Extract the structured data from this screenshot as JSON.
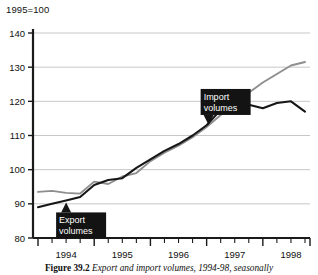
{
  "chart_data": {
    "type": "line",
    "title": "1995=100",
    "xlabel": "",
    "ylabel": "",
    "ylim": [
      80,
      140
    ],
    "yticks": [
      80,
      90,
      100,
      110,
      120,
      130,
      140
    ],
    "grid": true,
    "legend_position": "inline-callouts",
    "x_tick_labels": [
      "1994",
      "1995",
      "1996",
      "1997",
      "1998"
    ],
    "x": [
      "1994Q1",
      "1994Q2",
      "1994Q3",
      "1994Q4",
      "1995Q1",
      "1995Q2",
      "1995Q3",
      "1995Q4",
      "1996Q1",
      "1996Q2",
      "1996Q3",
      "1996Q4",
      "1997Q1",
      "1997Q2",
      "1997Q3",
      "1997Q4",
      "1998Q1",
      "1998Q2",
      "1998Q3",
      "1998Q4"
    ],
    "series": [
      {
        "name": "Export volumes",
        "color": "#171717",
        "values": [
          89.0,
          90.0,
          91.0,
          92.0,
          95.5,
          97.0,
          97.5,
          100.5,
          103.0,
          105.5,
          107.5,
          110.0,
          113.0,
          117.5,
          119.5,
          119.0,
          118.0,
          119.5,
          120.0,
          117.0
        ]
      },
      {
        "name": "Import volumes",
        "color": "#8e8e8e",
        "values": [
          93.5,
          93.8,
          93.2,
          93.0,
          96.5,
          95.8,
          98.0,
          99.0,
          102.5,
          105.0,
          107.0,
          109.5,
          112.5,
          116.0,
          120.5,
          122.5,
          125.5,
          128.0,
          130.5,
          131.5
        ]
      }
    ],
    "annotations": [
      {
        "label_line1": "Export",
        "label_line2": "volumes",
        "points_to": "1994Q3",
        "pointer": "up"
      },
      {
        "label_line1": "Import",
        "label_line2": "volumes",
        "points_to": "1997Q1",
        "pointer": "down"
      }
    ]
  },
  "caption": {
    "figure_number": "Figure 39.2",
    "text": "Export and import volumes, 1994-98, seasonally"
  }
}
